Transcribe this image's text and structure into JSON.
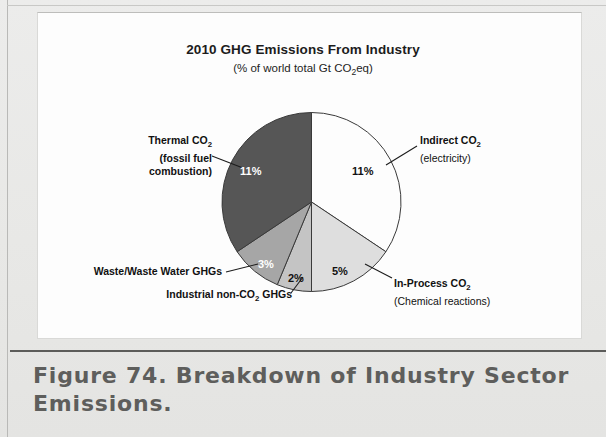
{
  "figure": {
    "caption": "Figure 74. Breakdown of Industry Sector Emissions."
  },
  "chart_data": {
    "type": "pie",
    "title": "2010 GHG Emissions From Industry",
    "subtitle": "(% of world total Gt CO2eq)",
    "subtitle_parts": {
      "pre": "(% of world total Gt CO",
      "sub": "2",
      "post": "eq)"
    },
    "unit": "% of world total Gt CO2eq",
    "legend_position": "callout-labels",
    "total": 32,
    "categories": [
      "Indirect CO2 (electricity)",
      "In-Process CO2 (Chemical reactions)",
      "Industrial non-CO2 GHGs",
      "Waste/Waste Water GHGs",
      "Thermal CO2 (fossil fuel combustion)"
    ],
    "values": [
      11,
      5,
      2,
      3,
      11
    ],
    "value_labels": [
      "11%",
      "5%",
      "2%",
      "3%",
      "11%"
    ],
    "colors": [
      "#fdfdfd",
      "#dedede",
      "#c4c4c4",
      "#a6a6a6",
      "#565656"
    ],
    "slices": [
      {
        "name": "indirect-co2",
        "label_line1_pre": "Indirect CO",
        "label_line1_sub": "2",
        "label_line2": "(electricity)",
        "value": 11,
        "value_label": "11%",
        "color": "#fdfdfd",
        "label_color": "#111111"
      },
      {
        "name": "in-process-co2",
        "label_line1_pre": "In-Process CO",
        "label_line1_sub": "2",
        "label_line2": "(Chemical reactions)",
        "value": 5,
        "value_label": "5%",
        "color": "#dedede",
        "label_color": "#111111"
      },
      {
        "name": "industrial-non-co2-ghgs",
        "label_line1_pre": "Industrial non-CO",
        "label_line1_sub": "2",
        "label_line1_post": " GHGs",
        "value": 2,
        "value_label": "2%",
        "color": "#c4c4c4",
        "label_color": "#111111"
      },
      {
        "name": "waste-water-ghgs",
        "label_line1_pre": "Waste/Waste Water GHGs",
        "value": 3,
        "value_label": "3%",
        "color": "#a6a6a6",
        "label_color": "#ffffff"
      },
      {
        "name": "thermal-co2",
        "label_line1_pre": "Thermal CO",
        "label_line1_sub": "2",
        "label_line2": "(fossil fuel",
        "label_line3": "combustion)",
        "value": 11,
        "value_label": "11%",
        "color": "#565656",
        "label_color": "#ffffff"
      }
    ]
  }
}
